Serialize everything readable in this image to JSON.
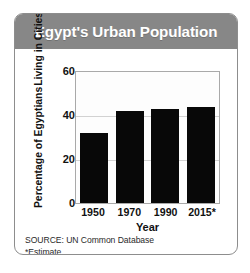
{
  "card": {
    "title": "Egypt's Urban Population",
    "title_color": "#ffffff",
    "header_color": "#878787",
    "border_color": "#8d8d8d"
  },
  "notes": {
    "source": "SOURCE: UN Common Database",
    "estimate": "*Estimate"
  },
  "chart_data": {
    "type": "bar",
    "title": "Egypt's Urban Population",
    "categories": [
      "1950",
      "1970",
      "1990",
      "2015*"
    ],
    "values": [
      32,
      42,
      43,
      44
    ],
    "xlabel": "Year",
    "ylabel": "Percentage of Egyptians Living in Cities",
    "ylabel_line1": "Percentage of Egyptians",
    "ylabel_line2": "Living in Cities",
    "ylim": [
      0,
      60
    ],
    "yticks": [
      60,
      40,
      20,
      0
    ],
    "ytick_labels": [
      "60",
      "40",
      "20",
      "0"
    ],
    "grid": true,
    "legend": false,
    "bar_color": "#080808",
    "plot_border_color": "#a9a9a9",
    "gridline_color": "#d2d2d2"
  }
}
